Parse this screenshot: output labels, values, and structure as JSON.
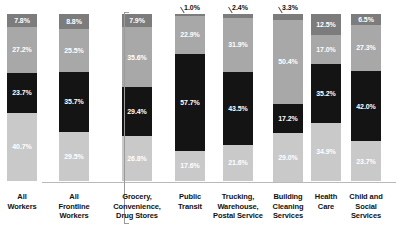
{
  "chart_data": {
    "type": "bar",
    "subtype": "stacked-100-percent",
    "title": "",
    "xlabel": "",
    "ylabel": "",
    "ylim": [
      0,
      100
    ],
    "grid": false,
    "legend_position": "left-axis-labels",
    "stack_order_top_to_bottom": [
      "Asian",
      "Latinx",
      "Black",
      "White"
    ],
    "categories": [
      "All Workers",
      "All Frontline Workers",
      "Grocery, Convenience, Drug Stores",
      "Public Transit",
      "Trucking, Warehouse, Postal Service",
      "Building Cleaning Services",
      "Health Care",
      "Child and Social Services"
    ],
    "series": [
      {
        "name": "Asian",
        "color": "#7c7c7c",
        "values": [
          7.8,
          8.8,
          7.9,
          1.0,
          2.4,
          3.3,
          12.5,
          6.5
        ]
      },
      {
        "name": "Latinx",
        "color": "#a8a8a8",
        "values": [
          27.2,
          25.5,
          35.6,
          22.9,
          31.9,
          50.4,
          17.0,
          27.3
        ]
      },
      {
        "name": "Black",
        "color": "#141414",
        "values": [
          23.7,
          35.7,
          29.4,
          57.7,
          43.5,
          17.2,
          35.2,
          42.0
        ]
      },
      {
        "name": "White",
        "color": "#c9c9c9",
        "values": [
          40.7,
          29.5,
          26.8,
          17.6,
          21.6,
          29.0,
          34.9,
          23.7
        ]
      }
    ],
    "annotations": [
      {
        "text": "1.0%",
        "series": "Asian",
        "category": "Public Transit"
      },
      {
        "text": "2.4%",
        "series": "Asian",
        "category": "Trucking, Warehouse, Postal Service"
      },
      {
        "text": "3.3%",
        "series": "Asian",
        "category": "Building Cleaning Services"
      }
    ]
  },
  "axis": {
    "row_labels": [
      "Asian",
      "Latinx",
      "Black",
      "White"
    ],
    "x_tick_labels": [
      [
        "All",
        "Workers"
      ],
      [
        "All",
        "Frontline",
        "Workers"
      ],
      [
        "Grocery,",
        "Convenience,",
        "Drug Stores"
      ],
      [
        "Public",
        "Transit"
      ],
      [
        "Trucking,",
        "Warehouse,",
        "Postal Service"
      ],
      [
        "Building",
        "Cleaning",
        "Services"
      ],
      [
        "Health",
        "Care"
      ],
      [
        "Child and",
        "Social",
        "Services"
      ]
    ]
  },
  "bars": [
    {
      "name": "All Workers",
      "segments": [
        {
          "label": "7.8%",
          "cls": "asian",
          "pct": 7.8,
          "show": true
        },
        {
          "label": "27.2%",
          "cls": "latinx",
          "pct": 27.2,
          "show": true
        },
        {
          "label": "23.7%",
          "cls": "black",
          "pct": 23.7,
          "show": true
        },
        {
          "label": "40.7%",
          "cls": "white",
          "pct": 40.7,
          "show": true
        }
      ]
    },
    {
      "name": "All Frontline Workers",
      "segments": [
        {
          "label": "8.8%",
          "cls": "asian",
          "pct": 8.8,
          "show": true
        },
        {
          "label": "25.5%",
          "cls": "latinx",
          "pct": 25.5,
          "show": true
        },
        {
          "label": "35.7%",
          "cls": "black",
          "pct": 35.7,
          "show": true
        },
        {
          "label": "29.5%",
          "cls": "white",
          "pct": 29.5,
          "show": true
        }
      ]
    },
    {
      "name": "Grocery, Convenience, Drug Stores",
      "segments": [
        {
          "label": "7.9%",
          "cls": "asian",
          "pct": 7.9,
          "show": true
        },
        {
          "label": "35.6%",
          "cls": "latinx",
          "pct": 35.6,
          "show": true
        },
        {
          "label": "29.4%",
          "cls": "black",
          "pct": 29.4,
          "show": true
        },
        {
          "label": "26.8%",
          "cls": "white",
          "pct": 26.8,
          "show": true
        }
      ]
    },
    {
      "name": "Public Transit",
      "segments": [
        {
          "label": "1.0%",
          "cls": "asian",
          "pct": 1.0,
          "show": false
        },
        {
          "label": "22.9%",
          "cls": "latinx",
          "pct": 22.9,
          "show": true
        },
        {
          "label": "57.7%",
          "cls": "black",
          "pct": 57.7,
          "show": true
        },
        {
          "label": "17.6%",
          "cls": "white",
          "pct": 17.6,
          "show": true
        }
      ]
    },
    {
      "name": "Trucking, Warehouse, Postal Service",
      "segments": [
        {
          "label": "2.4%",
          "cls": "asian",
          "pct": 2.4,
          "show": false
        },
        {
          "label": "31.9%",
          "cls": "latinx",
          "pct": 31.9,
          "show": true
        },
        {
          "label": "43.5%",
          "cls": "black",
          "pct": 43.5,
          "show": true
        },
        {
          "label": "21.6%",
          "cls": "white",
          "pct": 21.6,
          "show": true
        }
      ]
    },
    {
      "name": "Building Cleaning Services",
      "segments": [
        {
          "label": "3.3%",
          "cls": "asian",
          "pct": 3.3,
          "show": false
        },
        {
          "label": "50.4%",
          "cls": "latinx",
          "pct": 50.4,
          "show": true
        },
        {
          "label": "17.2%",
          "cls": "black",
          "pct": 17.2,
          "show": true
        },
        {
          "label": "29.0%",
          "cls": "white",
          "pct": 29.0,
          "show": true
        }
      ]
    },
    {
      "name": "Health Care",
      "segments": [
        {
          "label": "12.5%",
          "cls": "asian",
          "pct": 12.5,
          "show": true
        },
        {
          "label": "17.0%",
          "cls": "latinx",
          "pct": 17.0,
          "show": true
        },
        {
          "label": "35.2%",
          "cls": "black",
          "pct": 35.2,
          "show": true
        },
        {
          "label": "34.9%",
          "cls": "white",
          "pct": 34.9,
          "show": true
        }
      ]
    },
    {
      "name": "Child and Social Services",
      "segments": [
        {
          "label": "6.5%",
          "cls": "asian",
          "pct": 6.5,
          "show": true
        },
        {
          "label": "27.3%",
          "cls": "latinx",
          "pct": 27.3,
          "show": true
        },
        {
          "label": "42.0%",
          "cls": "black",
          "pct": 42.0,
          "show": true
        },
        {
          "label": "23.7%",
          "cls": "white",
          "pct": 23.7,
          "show": true
        }
      ]
    }
  ],
  "callouts": [
    {
      "text": "1.0%",
      "bar": 3
    },
    {
      "text": "2.4%",
      "bar": 4
    },
    {
      "text": "3.3%",
      "bar": 5
    }
  ]
}
